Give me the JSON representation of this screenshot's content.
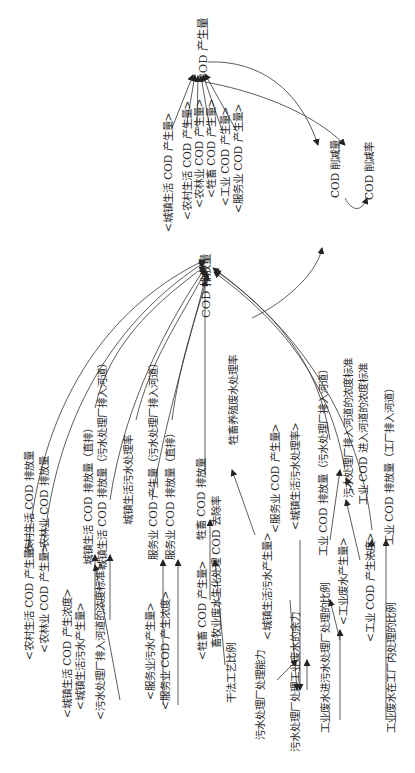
{
  "diagram": {
    "type": "system-dynamics-flow",
    "orientation": "rotated-90-ccw",
    "nodes": {
      "cod_generation": "COD 产生量",
      "cod_reduction_amount": "COD 削减量",
      "cod_reduction_rate": "COD 削减率",
      "cod_discharge": "COD 排放量",
      "shadow_urban_life_cod_gen": "<城镇生活 COD 产生量>",
      "shadow_rural_life_cod_gen": "<农村生活 COD 产生量>",
      "shadow_agroforestry_cod_gen": "<农林业 COD 产生量>",
      "shadow_livestock_cod_gen": "<牲畜 COD 产生量>",
      "shadow_industry_cod_gen": "<工业 COD 产生量>",
      "shadow_service_cod_gen": "<服务业 COD 产生量>",
      "rural_life_cod_discharge": "农村生活 COD 排放量",
      "agroforestry_cod_discharge": "农林业 COD 排放量",
      "shadow_rural_life_cod_gen_2": "<农村生活 COD 产生量>",
      "shadow_agroforestry_cod_gen_2": "<农林业 COD 产生量>",
      "urban_life_cod_direct": "城镇生活 COD 排放量（直排）",
      "urban_life_cod_plant": "城镇生活 COD 排放量（污水处理厂排入河道）",
      "urban_sewage_treatment_rate": "城镇生活污水处理率",
      "shadow_urban_life_cod_conc": "<城镇生活 COD 产生浓度>",
      "shadow_urban_sewage_gen": "<城镇生活污水产生量>",
      "shadow_plant_river_std": "<污水处理厂排入河道的浓度标准>",
      "service_cod_gen": "服务业 COD 产生量（污水处理厂排入河道）",
      "service_cod_direct": "服务业 COD 排放量（直排）",
      "shadow_service_sewage_gen": "<服务业污水产生量>",
      "shadow_service_cod_conc": "<服务业 COD 产生浓度>",
      "livestock_cod_discharge": "牲畜 COD 排放量",
      "livestock_wastewater_rate": "牲畜养殖废水处理率",
      "livestock_bio_cod_removal": "畜牧业废水生化处理 COD 去除率",
      "shadow_livestock_cod_gen_2": "<牲畜 COD 产生量>",
      "dry_process_ratio": "干法工艺比例",
      "shadow_service_cod_gen_2": "<服务业 COD 产生量>",
      "shadow_urban_sewage_rate": "<城镇生活污水处理率>",
      "shadow_urban_sewage_gen_2": "<城镇生活污水产生量>",
      "plant_capacity": "污水处理厂处理能力",
      "plant_surplus": "污水处理厂处理工业废水的余力",
      "industry_cod_plant": "工业 COD 排放量（污水处理厂排入河道）",
      "plant_river_std": "污水处理厂排入河道的浓度标准",
      "industry_cod_river_std": "工业 COD 进入河道的浓度标准",
      "industry_cod_factory": "工业 COD 排放量（工厂排入河道）",
      "shadow_industry_wastewater_gen": "<工业废水产生量>",
      "shadow_industry_cod_conc": "<工业 COD 产生浓度>",
      "industry_ww_to_plant_ratio": "工业废水进污水处理厂处理的比例",
      "industry_ww_in_factory_ratio": "工业废水在工厂内处理的比例"
    }
  }
}
